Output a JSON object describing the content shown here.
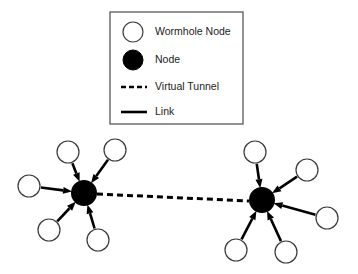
{
  "figure": {
    "background_color": "#ffffff",
    "width": 358,
    "height": 274
  },
  "legend": {
    "box": {
      "x": 110,
      "y": 12,
      "width": 133,
      "height": 112
    },
    "border_color": "#4a4a4a",
    "fill_color": "#ffffff",
    "entries": [
      {
        "id": "wormhole-node",
        "label": "Wormhole Node",
        "marker": "open-circle",
        "fill": "#ffffff",
        "stroke": "#3a3a3a",
        "marker_x": 133,
        "marker_y": 32,
        "radius": 10,
        "text_x": 155,
        "text_y": 32
      },
      {
        "id": "node",
        "label": "Node",
        "marker": "filled-circle",
        "fill": "#000000",
        "stroke": "#000000",
        "marker_x": 133,
        "marker_y": 60,
        "radius": 10,
        "text_x": 155,
        "text_y": 60
      },
      {
        "id": "virtual-tunnel",
        "label": "Virtual Tunnel",
        "marker": "dashed-line",
        "stroke": "#000000",
        "line_x1": 121,
        "line_x2": 147,
        "line_y": 87,
        "stroke_width": 2.6,
        "dash_pattern": "5,3",
        "text_x": 155,
        "text_y": 87
      },
      {
        "id": "link",
        "label": "Link",
        "marker": "solid-line",
        "stroke": "#000000",
        "line_x1": 121,
        "line_x2": 147,
        "line_y": 112,
        "stroke_width": 2.6,
        "text_x": 155,
        "text_y": 112
      }
    ]
  },
  "network": {
    "hub_color": "#000000",
    "node_fill": "#ffffff",
    "node_stroke": "#3a3a3a",
    "node_stroke_width": 1.2,
    "node_radius": 11,
    "hub_radius": 13,
    "link_color": "#000000",
    "link_width": 2.6,
    "tunnel_color": "#000000",
    "tunnel_width": 3,
    "tunnel_dash": "6,4",
    "hubs": [
      {
        "id": "wormhole-hub-left",
        "label": "Left Wormhole Node",
        "x": 84,
        "y": 193
      },
      {
        "id": "wormhole-hub-right",
        "label": "Right Wormhole Node",
        "x": 262,
        "y": 200
      }
    ],
    "tunnel": {
      "id": "virtual-tunnel-link",
      "from": "wormhole-hub-left",
      "to": "wormhole-hub-right",
      "x1": 97,
      "y1": 194,
      "x2": 249,
      "y2": 201
    },
    "nodes": [
      {
        "id": "node-l1",
        "cluster": "left",
        "x": 68,
        "y": 152
      },
      {
        "id": "node-l2",
        "cluster": "left",
        "x": 115,
        "y": 150
      },
      {
        "id": "node-l3",
        "cluster": "left",
        "x": 29,
        "y": 186
      },
      {
        "id": "node-l4",
        "cluster": "left",
        "x": 49,
        "y": 230
      },
      {
        "id": "node-l5",
        "cluster": "left",
        "x": 98,
        "y": 240
      },
      {
        "id": "node-r1",
        "cluster": "right",
        "x": 255,
        "y": 152
      },
      {
        "id": "node-r2",
        "cluster": "right",
        "x": 307,
        "y": 170
      },
      {
        "id": "node-r3",
        "cluster": "right",
        "x": 327,
        "y": 218
      },
      {
        "id": "node-r4",
        "cluster": "right",
        "x": 236,
        "y": 250
      },
      {
        "id": "node-r5",
        "cluster": "right",
        "x": 286,
        "y": 252
      }
    ],
    "links": [
      {
        "id": "link-l1",
        "from": "node-l1",
        "to": "wormhole-hub-left",
        "direction": "inbound"
      },
      {
        "id": "link-l2",
        "from": "node-l2",
        "to": "wormhole-hub-left",
        "direction": "inbound"
      },
      {
        "id": "link-l3",
        "from": "node-l3",
        "to": "wormhole-hub-left",
        "direction": "inbound"
      },
      {
        "id": "link-l4",
        "from": "node-l4",
        "to": "wormhole-hub-left",
        "direction": "inbound"
      },
      {
        "id": "link-l5",
        "from": "node-l5",
        "to": "wormhole-hub-left",
        "direction": "inbound"
      },
      {
        "id": "link-r1",
        "from": "node-r1",
        "to": "wormhole-hub-right",
        "direction": "inbound"
      },
      {
        "id": "link-r2",
        "from": "node-r2",
        "to": "wormhole-hub-right",
        "direction": "inbound"
      },
      {
        "id": "link-r3",
        "from": "node-r3",
        "to": "wormhole-hub-right",
        "direction": "inbound"
      },
      {
        "id": "link-r4",
        "from": "node-r4",
        "to": "wormhole-hub-right",
        "direction": "inbound"
      },
      {
        "id": "link-r5",
        "from": "node-r5",
        "to": "wormhole-hub-right",
        "direction": "inbound"
      }
    ]
  }
}
